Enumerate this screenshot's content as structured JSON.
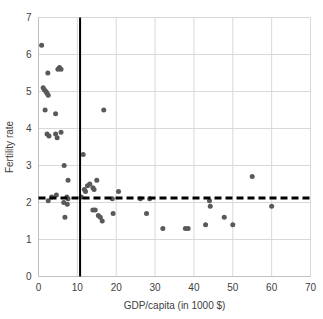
{
  "chart_data": {
    "type": "scatter",
    "title": "",
    "xlabel": "GDP/capita (in 1000 $)",
    "ylabel": "Fertility rate",
    "xlim": [
      0,
      70
    ],
    "ylim": [
      0,
      7
    ],
    "xticks": [
      "0",
      "10",
      "20",
      "30",
      "40",
      "50",
      "60",
      "70"
    ],
    "yticks": [
      "0",
      "1",
      "2",
      "3",
      "4",
      "5",
      "6",
      "7"
    ],
    "grid": true,
    "legend": "none",
    "marker_color": "#595959",
    "marker_size": 5,
    "points": [
      {
        "x": 0.8,
        "y": 6.25
      },
      {
        "x": 2.4,
        "y": 5.5
      },
      {
        "x": 5.0,
        "y": 5.6
      },
      {
        "x": 5.4,
        "y": 5.65
      },
      {
        "x": 5.8,
        "y": 5.6
      },
      {
        "x": 1.2,
        "y": 5.1
      },
      {
        "x": 1.5,
        "y": 5.05
      },
      {
        "x": 1.9,
        "y": 5.0
      },
      {
        "x": 2.2,
        "y": 4.95
      },
      {
        "x": 2.5,
        "y": 4.9
      },
      {
        "x": 1.7,
        "y": 4.5
      },
      {
        "x": 4.4,
        "y": 4.4
      },
      {
        "x": 16.8,
        "y": 4.5
      },
      {
        "x": 2.2,
        "y": 3.85
      },
      {
        "x": 2.7,
        "y": 3.8
      },
      {
        "x": 4.4,
        "y": 3.85
      },
      {
        "x": 4.8,
        "y": 3.75
      },
      {
        "x": 5.8,
        "y": 3.9
      },
      {
        "x": 11.5,
        "y": 3.3
      },
      {
        "x": 6.6,
        "y": 3.0
      },
      {
        "x": 7.6,
        "y": 2.6
      },
      {
        "x": 55.0,
        "y": 2.7
      },
      {
        "x": 12.6,
        "y": 2.45
      },
      {
        "x": 13.2,
        "y": 2.5
      },
      {
        "x": 14.0,
        "y": 2.4
      },
      {
        "x": 15.0,
        "y": 2.6
      },
      {
        "x": 11.8,
        "y": 2.35
      },
      {
        "x": 12.1,
        "y": 2.3
      },
      {
        "x": 14.3,
        "y": 2.35
      },
      {
        "x": 20.6,
        "y": 2.3
      },
      {
        "x": 3.4,
        "y": 2.15
      },
      {
        "x": 4.6,
        "y": 2.2
      },
      {
        "x": 7.3,
        "y": 2.15
      },
      {
        "x": 7.6,
        "y": 2.1
      },
      {
        "x": 11.0,
        "y": 2.15
      },
      {
        "x": 2.5,
        "y": 2.05
      },
      {
        "x": 6.5,
        "y": 2.0
      },
      {
        "x": 7.4,
        "y": 1.95
      },
      {
        "x": 19.0,
        "y": 2.1
      },
      {
        "x": 26.2,
        "y": 2.1
      },
      {
        "x": 28.6,
        "y": 2.1
      },
      {
        "x": 44.0,
        "y": 2.05
      },
      {
        "x": 44.2,
        "y": 1.9
      },
      {
        "x": 60.0,
        "y": 1.9
      },
      {
        "x": 14.0,
        "y": 1.8
      },
      {
        "x": 14.6,
        "y": 1.8
      },
      {
        "x": 15.4,
        "y": 1.65
      },
      {
        "x": 15.9,
        "y": 1.6
      },
      {
        "x": 16.4,
        "y": 1.5
      },
      {
        "x": 19.2,
        "y": 1.7
      },
      {
        "x": 27.8,
        "y": 1.7
      },
      {
        "x": 47.8,
        "y": 1.6
      },
      {
        "x": 6.8,
        "y": 1.6
      },
      {
        "x": 32.0,
        "y": 1.3
      },
      {
        "x": 37.8,
        "y": 1.3
      },
      {
        "x": 38.5,
        "y": 1.3
      },
      {
        "x": 43.0,
        "y": 1.4
      },
      {
        "x": 50.0,
        "y": 1.4
      }
    ],
    "reference_lines": [
      {
        "name": "vertical-threshold",
        "orientation": "vertical",
        "value": 10.7,
        "style": "solid",
        "color": "#000000",
        "width": 2
      },
      {
        "name": "horizontal-replacement-level",
        "orientation": "horizontal",
        "value": 2.12,
        "style": "dashed",
        "color": "#000000",
        "width": 3
      }
    ]
  }
}
